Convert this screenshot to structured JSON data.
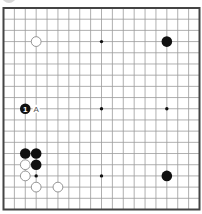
{
  "diagram": {
    "type": "go-board",
    "size": 19,
    "colors": {
      "background": "#ffffff",
      "grid_line": "#9a9a9a",
      "border": "#444444",
      "black_stone": "#111111",
      "white_stone_fill": "#ffffff",
      "white_stone_stroke": "#8a8a8a",
      "star_point": "#111111",
      "label": "#555555"
    },
    "star_points": [
      [
        3,
        3
      ],
      [
        9,
        3
      ],
      [
        15,
        3
      ],
      [
        3,
        9
      ],
      [
        9,
        9
      ],
      [
        15,
        9
      ],
      [
        3,
        15
      ],
      [
        9,
        15
      ],
      [
        15,
        15
      ]
    ],
    "stones": [
      {
        "color": "white",
        "col": 3,
        "row": 3
      },
      {
        "color": "black",
        "col": 15,
        "row": 3
      },
      {
        "color": "black",
        "col": 2,
        "row": 9,
        "number": "1"
      },
      {
        "color": "black",
        "col": 2,
        "row": 13
      },
      {
        "color": "black",
        "col": 3,
        "row": 13
      },
      {
        "color": "white",
        "col": 2,
        "row": 14
      },
      {
        "color": "black",
        "col": 3,
        "row": 14
      },
      {
        "color": "white",
        "col": 2,
        "row": 15
      },
      {
        "color": "white",
        "col": 3,
        "row": 16
      },
      {
        "color": "white",
        "col": 5,
        "row": 16
      },
      {
        "color": "black",
        "col": 15,
        "row": 15
      }
    ],
    "labels": [
      {
        "text": "A",
        "col": 3,
        "row": 9
      }
    ]
  }
}
